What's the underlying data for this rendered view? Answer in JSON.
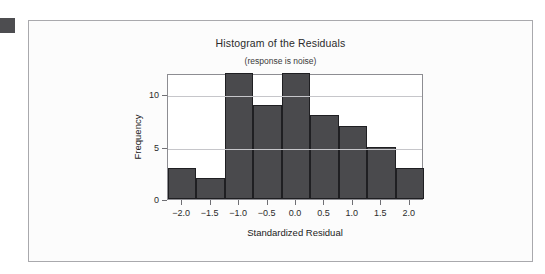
{
  "marker": {
    "name": "corner-square"
  },
  "chart_data": {
    "type": "bar",
    "title": "Histogram of the Residuals",
    "subtitle": "(response is noise)",
    "xlabel": "Standardized Residual",
    "ylabel": "Frequency",
    "bin_edges": [
      -2.25,
      -1.75,
      -1.25,
      -0.75,
      -0.25,
      0.25,
      0.75,
      1.25,
      1.75,
      2.25
    ],
    "categories": [
      "-2.0",
      "-1.5",
      "-1.0",
      "-0.5",
      "0.0",
      "0.5",
      "1.0",
      "1.5",
      "2.0"
    ],
    "values": [
      3,
      2,
      12,
      9,
      12,
      8,
      7,
      5,
      3
    ],
    "xtick_labels": [
      "−2.0",
      "−1.5",
      "−1.0",
      "−0.5",
      "0.0",
      "0.5",
      "1.0",
      "1.5",
      "2.0"
    ],
    "xtick_values": [
      -2.0,
      -1.5,
      -1.0,
      -0.5,
      0.0,
      0.5,
      1.0,
      1.5,
      2.0
    ],
    "ytick_labels": [
      "0",
      "5",
      "10"
    ],
    "ytick_values": [
      0,
      5,
      10
    ],
    "xlim": [
      -2.25,
      2.25
    ],
    "ylim": [
      0,
      12
    ],
    "gridlines": [
      5,
      10
    ],
    "grid": true,
    "legend": "none",
    "bar_color": "#4a4a4d",
    "bar_edge_color": "#1f1f22",
    "grid_color": "#c6c6ca",
    "plot_background": "#ffffff",
    "card_background": "#fcfcfc"
  }
}
